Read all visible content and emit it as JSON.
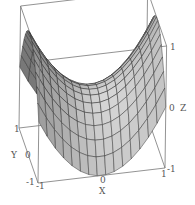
{
  "chart_data": {
    "type": "surface3d",
    "title": "",
    "function": "z = x^2 - y^2 (saddle)",
    "xlabel": "X",
    "ylabel": "Y",
    "zlabel": "Z",
    "xlim": [
      -1,
      1
    ],
    "ylim": [
      -1,
      1
    ],
    "zlim": [
      -1,
      1
    ],
    "grid_lines": 15,
    "box": true,
    "surface_color": "#b9b9b9",
    "mesh_color": "#2a2a2a",
    "ticks": {
      "x": [
        "-1",
        "0",
        "1"
      ],
      "y": [
        "-1",
        "0",
        "1"
      ],
      "z": [
        "-1",
        "0",
        "1"
      ]
    }
  },
  "labels": {
    "x_axis": "X",
    "y_axis": "Y",
    "z_axis": "Z",
    "x_tick_min": "-1",
    "x_tick_mid": "0",
    "x_tick_max": "1",
    "y_tick_min": "-1",
    "y_tick_mid": "0",
    "y_tick_max": "1",
    "z_tick_min": "-1",
    "z_tick_mid": "0",
    "z_tick_max": "1"
  }
}
